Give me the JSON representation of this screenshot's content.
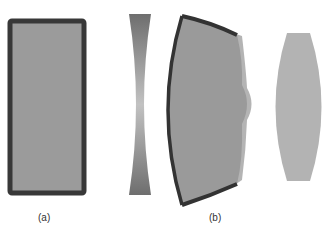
{
  "figure": {
    "panels": [
      {
        "id": "a",
        "label": "(a)",
        "description": "rectangular block with thick dark border"
      },
      {
        "id": "b",
        "label": "(b)",
        "description": "concave lens, deformed block with curved faces, and biconvex lens"
      }
    ],
    "colors": {
      "border": "#3a3a3a",
      "fill": "#9a9a9a",
      "fill_light": "#b0b0b0",
      "lens_gradient_dark": "#707070",
      "lens_gradient_light": "#c4c4c4",
      "background": "#ffffff"
    }
  }
}
